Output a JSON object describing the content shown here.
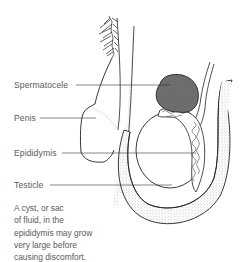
{
  "figure": {
    "subject": "Spermatocele",
    "labels": [
      {
        "id": "spermatocele",
        "text": "Spermatocele"
      },
      {
        "id": "penis",
        "text": "Penis"
      },
      {
        "id": "epididymis",
        "text": "Epididymis"
      },
      {
        "id": "testicle",
        "text": "Testicle"
      }
    ],
    "caption_lines": [
      "A cyst, or sac",
      "of fluid, in the",
      "epididymis may grow",
      "very large before",
      "causing discomfort."
    ]
  },
  "colors": {
    "background": "#ffffff",
    "outline": "#222222",
    "label_text": "#5a5a5a",
    "spermatocele_fill": "#6e6e6e",
    "stipple": "#b8b8b8"
  }
}
